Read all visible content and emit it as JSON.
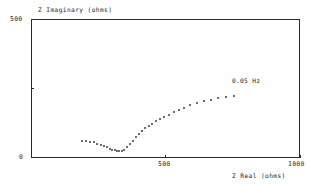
{
  "figure": {
    "background_color": "#ffffff",
    "line_color": "#2b2b2b",
    "marker_color": "#3c3c3c"
  },
  "annotations": {
    "frequency_label": "0.05 Hz"
  },
  "chart_data": {
    "type": "scatter",
    "title": "",
    "subtitle": "",
    "xlabel": "Z Real (ohms)",
    "ylabel": "Z Imaginary (ohms)",
    "xlim": [
      0,
      1000
    ],
    "ylim": [
      0,
      500
    ],
    "xticks": [
      500,
      1000
    ],
    "xticklabels": [
      "500",
      "1000"
    ],
    "yticks": [
      0,
      500
    ],
    "yticklabels": [
      "0",
      "500"
    ],
    "grid": false,
    "legend": null,
    "marker": "dot",
    "annotations": [
      {
        "text": "0.05 Hz",
        "x": 790,
        "y": 278
      }
    ],
    "series": [
      {
        "name": "impedance",
        "x": [
          188,
          203,
          218,
          233,
          247,
          260,
          272,
          283,
          293,
          302,
          311,
          320,
          328,
          337,
          347,
          358,
          368,
          378,
          389,
          400,
          412,
          424,
          437,
          450,
          464,
          479,
          495,
          512,
          530,
          549,
          570,
          592,
          616,
          642,
          668,
          696,
          724,
          755
        ],
        "y": [
          62,
          60,
          58,
          56,
          52,
          48,
          43,
          38,
          34,
          30,
          27,
          25,
          24,
          25,
          30,
          39,
          50,
          62,
          74,
          86,
          97,
          107,
          116,
          124,
          132,
          140,
          148,
          156,
          164,
          172,
          181,
          189,
          197,
          204,
          210,
          215,
          219,
          222
        ]
      }
    ]
  }
}
